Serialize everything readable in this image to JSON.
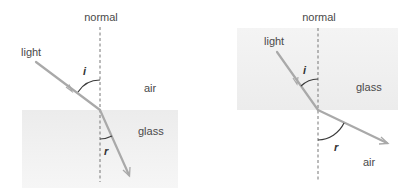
{
  "diagrams": [
    {
      "id": "air-to-glass",
      "labels": {
        "normal": "normal",
        "ray": "light",
        "angle_incidence": "i",
        "angle_refraction": "r",
        "top_medium": "air",
        "bottom_medium": "glass"
      }
    },
    {
      "id": "glass-to-air",
      "labels": {
        "normal": "normal",
        "ray": "light",
        "angle_incidence": "i",
        "angle_refraction": "r",
        "top_medium": "glass",
        "bottom_medium": "air"
      }
    }
  ],
  "colors": {
    "ray": "#a9a9a9",
    "glass": "#f0f0f0",
    "normal_line": "#777777",
    "arc": "#3a3a3a",
    "text": "#4a4a4a"
  }
}
